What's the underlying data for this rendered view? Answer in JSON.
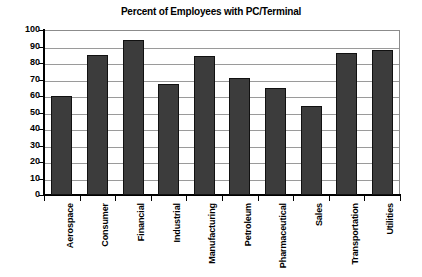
{
  "chart_data": {
    "type": "bar",
    "title": "Percent of Employees with PC/Terminal",
    "xlabel": "",
    "ylabel": "",
    "ylim": [
      0,
      100
    ],
    "ytick_step": 10,
    "yticks": [
      100,
      90,
      80,
      70,
      60,
      50,
      40,
      30,
      20,
      10,
      0
    ],
    "grid": true,
    "legend": "none",
    "categories": [
      "Aerospace",
      "Consumer",
      "Financial",
      "Industrial",
      "Manufacturing",
      "Petroleum",
      "Pharmaceutical",
      "Sales",
      "Transportation",
      "Utilities"
    ],
    "values": [
      60,
      85,
      94,
      67,
      84,
      71,
      65,
      54,
      86,
      88
    ],
    "bar_color": "#3c3c3c",
    "bar_edge_color": "#111111",
    "grid_color": "#9a9a9a",
    "axis_color": "#000000",
    "background_color": "#ffffff"
  }
}
